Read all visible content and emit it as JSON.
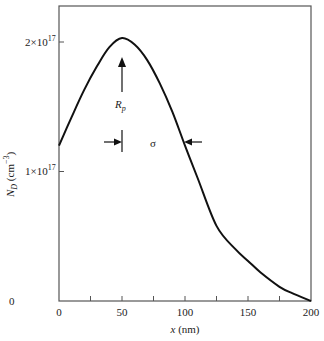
{
  "chart_data": {
    "type": "line",
    "title": "",
    "xlabel": "x (nm)",
    "ylabel": "N_D (cm^-3)",
    "xlim": [
      0,
      200
    ],
    "ylim": [
      0,
      2.3e+17
    ],
    "grid": false,
    "legend": null,
    "x_ticks": [
      0,
      50,
      100,
      150,
      200
    ],
    "x_tick_labels": [
      "0",
      "50",
      "100",
      "150",
      "200"
    ],
    "x_minor_ticks": [
      25,
      75,
      125,
      175
    ],
    "y_ticks": [
      0,
      1e+17,
      2e+17
    ],
    "y_tick_labels": [
      "0",
      "1×10^17",
      "2×10^17"
    ],
    "series": [
      {
        "name": "N_D profile",
        "x": [
          0,
          10,
          20,
          30,
          40,
          50,
          60,
          70,
          80,
          90,
          100,
          110,
          125,
          140,
          150,
          160,
          175,
          185,
          200
        ],
        "y": [
          1.2e+17,
          1.42e+17,
          1.63e+17,
          1.81e+17,
          1.96e+17,
          2.03e+17,
          1.98e+17,
          1.86e+17,
          1.68e+17,
          1.46e+17,
          1.2e+17,
          9.5e+16,
          5.8e+16,
          4e+16,
          3.1e+16,
          2.2e+16,
          1.1e+16,
          6000000000000000.0,
          0.0
        ]
      }
    ],
    "annotations": [
      {
        "label": "R_p",
        "type": "vertical-arrow",
        "x": 50,
        "y_from": 1.18e+17,
        "y_to": 1.85e+17
      },
      {
        "label": "σ",
        "type": "inward-arrows",
        "x_start": 50,
        "x_end": 100,
        "y": 1.22e+17
      }
    ]
  },
  "labels": {
    "x_axis": "x (nm)",
    "y_axis_main": "N",
    "y_axis_sub": "D",
    "y_axis_unit": "(cm",
    "y_axis_exp": "−3",
    "y_axis_close": ")",
    "rp_main": "R",
    "rp_sub": "p",
    "sigma": "σ",
    "ytick_0": "0",
    "ytick_1_base": "1×10",
    "ytick_1_exp": "17",
    "ytick_2_base": "2×10",
    "ytick_2_exp": "17",
    "xtick_0": "0",
    "xtick_50": "50",
    "xtick_100": "100",
    "xtick_150": "150",
    "xtick_200": "200"
  }
}
